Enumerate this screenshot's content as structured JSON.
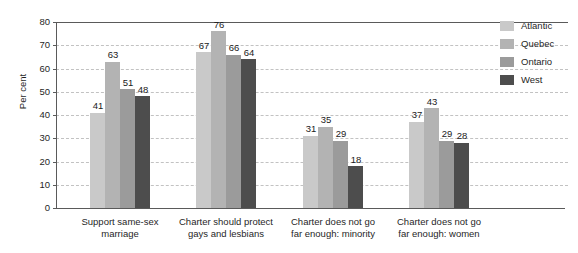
{
  "chart_data": {
    "type": "bar",
    "title": "",
    "xlabel": "",
    "ylabel": "Per cent",
    "ylim": [
      0,
      80
    ],
    "yticks": [
      0,
      10,
      20,
      30,
      40,
      50,
      60,
      70,
      80
    ],
    "ytick_labels": [
      "0",
      "10",
      "20",
      "30",
      "40",
      "50",
      "60",
      "70",
      "80"
    ],
    "grid": true,
    "legend_position": "top-right",
    "categories": [
      "Support same-sex marriage",
      "Charter should protect gays and lesbians",
      "Charter does not go far enough: minority",
      "Charter does not go far enough: women"
    ],
    "category_lines": [
      [
        "Support same-sex",
        "marriage"
      ],
      [
        "Charter should protect",
        "gays and lesbians"
      ],
      [
        "Charter does not go",
        "far enough: minority"
      ],
      [
        "Charter does not go",
        "far enough: women"
      ]
    ],
    "series": [
      {
        "name": "Atlantic",
        "color": "#c9c9c9",
        "values": [
          41,
          67,
          31,
          37
        ],
        "labels": [
          "41",
          "67",
          "31",
          "37"
        ]
      },
      {
        "name": "Quebec",
        "color": "#b3b3b3",
        "values": [
          63,
          76,
          35,
          43
        ],
        "labels": [
          "63",
          "76",
          "35",
          "43"
        ]
      },
      {
        "name": "Ontario",
        "color": "#9b9b9b",
        "values": [
          51,
          66,
          29,
          29
        ],
        "labels": [
          "51",
          "66",
          "29",
          "29"
        ]
      },
      {
        "name": "West",
        "color": "#4d4d4d",
        "values": [
          48,
          64,
          18,
          28
        ],
        "labels": [
          "48",
          "64",
          "18",
          "28"
        ]
      }
    ]
  },
  "legend": {
    "items": [
      {
        "label": "Atlantic",
        "color": "#c9c9c9"
      },
      {
        "label": "Quebec",
        "color": "#b3b3b3"
      },
      {
        "label": "Ontario",
        "color": "#9b9b9b"
      },
      {
        "label": "West",
        "color": "#4d4d4d"
      }
    ]
  },
  "axis": {
    "y_title": "Per cent"
  }
}
